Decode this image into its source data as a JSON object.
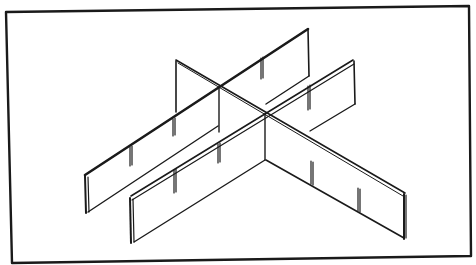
{
  "figure": {
    "title": "Isometric line drawing of interlocking slotted divider panels",
    "colors": {
      "background": "#ffffff",
      "stroke": "#1a1a1a",
      "edge_fill": "#ffffff"
    },
    "frame": {
      "points": [
        [
          6,
          12
        ],
        [
          469,
          6
        ],
        [
          471,
          256
        ],
        [
          12,
          263
        ]
      ]
    },
    "panels": [
      {
        "name": "back-long-panel",
        "count_notches": 3
      },
      {
        "name": "front-long-panel",
        "count_notches": 3
      },
      {
        "name": "cross-panel",
        "count_notches": 4
      }
    ]
  }
}
